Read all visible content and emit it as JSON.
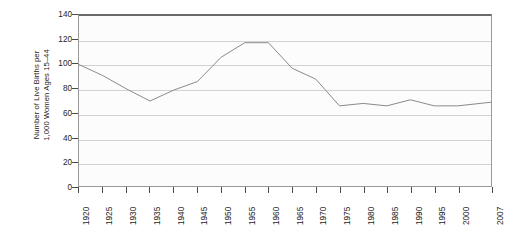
{
  "chart_data": {
    "type": "line",
    "title": "",
    "xlabel": "",
    "ylabel": "Number of Live Births per 1,000 Women Ages 15–44",
    "ylabel_line1": "Number of Live Births per",
    "ylabel_line2": "1,000 Women Ages 15–44",
    "ylim": [
      0,
      140
    ],
    "ytick_values": [
      0,
      20,
      40,
      60,
      80,
      100,
      120,
      140
    ],
    "ytick_labels": [
      "0",
      "20",
      "40",
      "60",
      "80",
      "100",
      "120",
      "140"
    ],
    "xlim": [
      1920,
      2007
    ],
    "xtick_values": [
      1920,
      1925,
      1930,
      1935,
      1940,
      1945,
      1950,
      1955,
      1960,
      1965,
      1970,
      1975,
      1980,
      1985,
      1990,
      1995,
      2000,
      2007
    ],
    "xtick_labels": [
      "1920",
      "1925",
      "1930",
      "1935",
      "1940",
      "1945",
      "1950",
      "1955",
      "1960",
      "1965",
      "1970",
      "1975",
      "1980",
      "1985",
      "1990",
      "1995",
      "2000",
      "2007"
    ],
    "grid": true,
    "grid_axis": "y",
    "legend": false,
    "legend_position": "none",
    "line_color": "#8a8a8a",
    "line_width": 1,
    "plot_background": "#fcfcfc",
    "frame_color": "#9a9a9a",
    "x": [
      1920,
      1925,
      1930,
      1935,
      1940,
      1945,
      1950,
      1955,
      1960,
      1965,
      1970,
      1975,
      1980,
      1985,
      1990,
      1995,
      2000,
      2007
    ],
    "values": [
      100,
      91,
      80,
      70,
      79,
      86,
      106,
      118,
      118,
      97,
      88,
      66,
      68,
      66,
      71,
      66,
      66,
      69
    ],
    "series": [
      {
        "name": "Birth rate",
        "values": [
          100,
          91,
          80,
          70,
          79,
          86,
          106,
          118,
          118,
          97,
          88,
          66,
          68,
          66,
          71,
          66,
          66,
          69
        ]
      }
    ]
  }
}
